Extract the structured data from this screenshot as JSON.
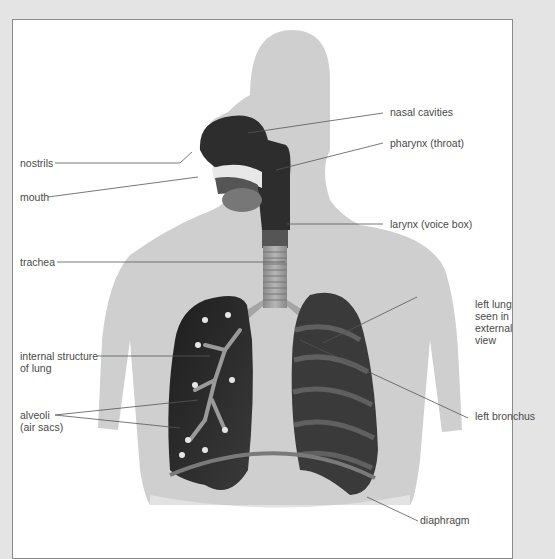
{
  "diagram": {
    "colors": {
      "background": "#e4e4e4",
      "panel": "#ffffff",
      "panel_border": "#8a8a8a",
      "body_silhouette": "#cfcfcf",
      "organ_dark": "#2b2b2b",
      "label_text": "#4a4a4a",
      "leader_line": "#555555"
    },
    "labels": {
      "nasal_cavities": "nasal cavities",
      "pharynx": "pharynx (throat)",
      "nostrils": "nostrils",
      "mouth": "mouth",
      "larynx": "larynx (voice box)",
      "trachea": "trachea",
      "left_lung_l1": "left lung",
      "left_lung_l2": "seen in",
      "left_lung_l3": "external",
      "left_lung_l4": "view",
      "internal_l1": "internal structure",
      "internal_l2": "of lung",
      "alveoli_l1": "alveoli",
      "alveoli_l2": "(air sacs)",
      "left_bronchus": "left bronchus",
      "diaphragm": "diaphragm"
    }
  }
}
